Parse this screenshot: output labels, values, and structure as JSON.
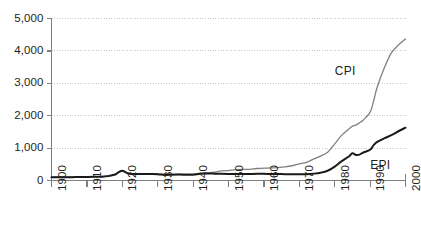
{
  "chart_data": {
    "type": "line",
    "title": "",
    "subtitle": "",
    "xlabel": "",
    "ylabel": "",
    "xlim": [
      1900,
      2000
    ],
    "ylim": [
      0,
      5000
    ],
    "grid": true,
    "grid_axis": "y",
    "legend": "inline-annotations",
    "y_ticks": [
      0,
      1000,
      2000,
      3000,
      4000,
      5000
    ],
    "y_tick_labels": [
      "0",
      "1,000",
      "2,000",
      "3,000",
      "4,000",
      "5,000"
    ],
    "x_ticks": [
      1900,
      1910,
      1920,
      1930,
      1940,
      1950,
      1960,
      1970,
      1980,
      1990,
      2000
    ],
    "x_tick_labels": [
      "1900",
      "1910",
      "1920",
      "1930",
      "1940",
      "1950",
      "1960",
      "1970",
      "1980",
      "1990",
      "2000"
    ],
    "x": [
      1900,
      1902,
      1904,
      1906,
      1908,
      1910,
      1912,
      1914,
      1916,
      1918,
      1919,
      1920,
      1921,
      1922,
      1924,
      1926,
      1928,
      1930,
      1932,
      1934,
      1936,
      1938,
      1940,
      1942,
      1944,
      1946,
      1948,
      1950,
      1952,
      1954,
      1956,
      1958,
      1960,
      1962,
      1964,
      1966,
      1968,
      1970,
      1972,
      1974,
      1976,
      1978,
      1980,
      1982,
      1984,
      1985,
      1986,
      1987,
      1988,
      1990,
      1991,
      1992,
      1994,
      1996,
      1998,
      2000
    ],
    "series": [
      {
        "name": "CPI",
        "color": "#808080",
        "label_annotation": "CPI",
        "values": [
          100,
          102,
          104,
          108,
          110,
          115,
          120,
          122,
          140,
          190,
          260,
          300,
          255,
          215,
          210,
          212,
          210,
          205,
          180,
          190,
          195,
          195,
          195,
          225,
          240,
          255,
          300,
          305,
          335,
          340,
          345,
          370,
          380,
          390,
          400,
          420,
          455,
          510,
          560,
          660,
          755,
          870,
          1130,
          1400,
          1590,
          1680,
          1710,
          1780,
          1860,
          2110,
          2460,
          2880,
          3470,
          3940,
          4180,
          4370
        ]
      },
      {
        "name": "EPI",
        "color": "#1a1a1a",
        "label_annotation": "EPI",
        "values": [
          100,
          100,
          102,
          104,
          106,
          110,
          114,
          118,
          135,
          185,
          260,
          300,
          250,
          208,
          200,
          202,
          200,
          196,
          172,
          180,
          182,
          180,
          178,
          205,
          215,
          212,
          205,
          200,
          198,
          198,
          200,
          205,
          205,
          200,
          198,
          196,
          192,
          190,
          192,
          210,
          240,
          300,
          430,
          600,
          740,
          840,
          790,
          800,
          860,
          950,
          1090,
          1190,
          1300,
          1400,
          1520,
          1630
        ]
      }
    ],
    "annotations": [
      {
        "text": "CPI",
        "x": 1984,
        "y": 3350
      },
      {
        "text": "EPI",
        "x": 1994,
        "y": 450
      }
    ]
  },
  "axis": {
    "line_color": "#808080",
    "grid_color": "#b9b9b9",
    "tick_text_color": "#231f20"
  }
}
